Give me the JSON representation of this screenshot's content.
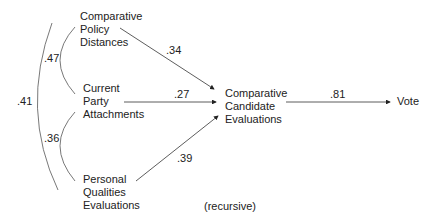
{
  "diagram": {
    "type": "path-diagram",
    "nodes": {
      "policy": {
        "lines": [
          "Comparative",
          "Policy",
          "Distances"
        ]
      },
      "party": {
        "lines": [
          "Current",
          "Party",
          "Attachments"
        ]
      },
      "personal": {
        "lines": [
          "Personal",
          "Qualities",
          "Evaluations"
        ]
      },
      "candidate": {
        "lines": [
          "Comparative",
          "Candidate",
          "Evaluations"
        ]
      },
      "vote": {
        "lines": [
          "Vote"
        ]
      }
    },
    "paths": {
      "policy_to_candidate": ".34",
      "party_to_candidate": ".27",
      "personal_to_candidate": ".39",
      "candidate_to_vote": ".81"
    },
    "correlations": {
      "policy_party": ".47",
      "party_personal": ".36",
      "policy_personal": ".41"
    },
    "note": "(recursive)"
  }
}
